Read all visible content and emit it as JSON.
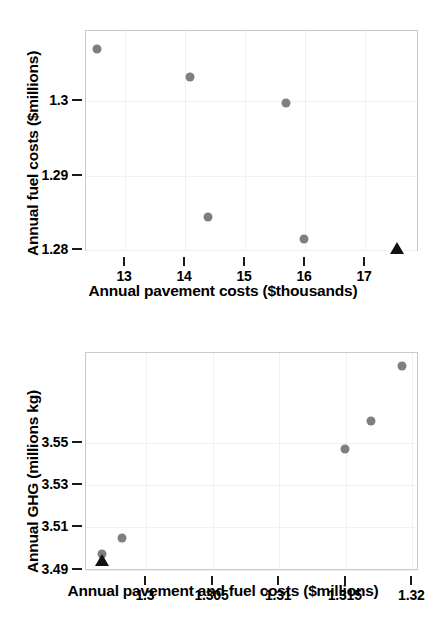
{
  "chart_data": [
    {
      "id": "fuel-vs-pavement",
      "type": "scatter",
      "title": "",
      "xlabel": "Annual pavement costs ($thousands)",
      "ylabel": "Annual fuel costs ($millions)",
      "xlim": [
        12.35,
        17.9
      ],
      "ylim": [
        1.2797,
        1.3095
      ],
      "xticks": [
        13,
        14,
        15,
        16,
        17
      ],
      "xticklabels": [
        "13",
        "14",
        "15",
        "16",
        "17"
      ],
      "yticks": [
        1.28,
        1.29,
        1.3
      ],
      "yticklabels": [
        "1.28",
        "1.29",
        "1.3"
      ],
      "grid": true,
      "legend": "none",
      "series": [
        {
          "name": "alternatives",
          "marker": "circle",
          "color": "#7f7f7f",
          "points": [
            {
              "x": 12.55,
              "y": 1.307
            },
            {
              "x": 14.1,
              "y": 1.3032
            },
            {
              "x": 15.7,
              "y": 1.2997
            },
            {
              "x": 14.4,
              "y": 1.2843
            },
            {
              "x": 16.0,
              "y": 1.2813
            }
          ]
        },
        {
          "name": "baseline",
          "marker": "triangle",
          "color": "#111111",
          "points": [
            {
              "x": 17.55,
              "y": 1.2801
            }
          ]
        }
      ]
    },
    {
      "id": "ghg-vs-total-cost",
      "type": "scatter",
      "title": "",
      "xlabel": "Annual pavement and fuel costs ($millions)",
      "ylabel": "Annual GHG (millions kg)",
      "xlim": [
        1.2955,
        1.3205
      ],
      "ylim": [
        3.4893,
        3.5923
      ],
      "xticks": [
        1.3,
        1.305,
        1.31,
        1.315,
        1.32
      ],
      "xticklabels": [
        "1.3",
        "1.305",
        "1.31",
        "1.315",
        "1.32"
      ],
      "yticks": [
        3.49,
        3.51,
        3.53,
        3.55
      ],
      "yticklabels": [
        "3.49",
        "3.51",
        "3.53",
        "3.55"
      ],
      "grid": true,
      "legend": "none",
      "series": [
        {
          "name": "alternatives",
          "marker": "circle",
          "color": "#7f7f7f",
          "points": [
            {
              "x": 1.2968,
              "y": 3.4967
            },
            {
              "x": 1.2983,
              "y": 3.5042
            },
            {
              "x": 1.31505,
              "y": 3.5465
            },
            {
              "x": 1.31695,
              "y": 3.5595
            },
            {
              "x": 1.3193,
              "y": 3.5855
            }
          ]
        },
        {
          "name": "baseline",
          "marker": "triangle",
          "color": "#111111",
          "points": [
            {
              "x": 1.2968,
              "y": 3.4938
            }
          ]
        }
      ]
    }
  ]
}
